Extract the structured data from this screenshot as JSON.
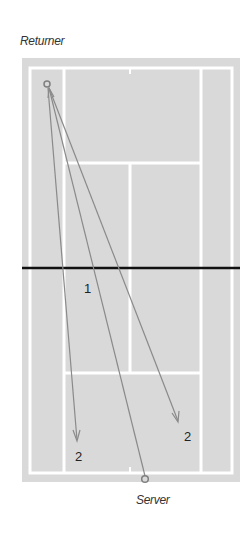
{
  "labels": {
    "top_player": "Returner",
    "bottom_player": "Server"
  },
  "colors": {
    "court_fill": "#d9d9d9",
    "court_lines": "#ffffff",
    "net": "#111111",
    "trajectory": "#8a8a8a",
    "marker": "#7f7f7f",
    "text": "#222222"
  },
  "court": {
    "surround": {
      "x": 22,
      "y": 58,
      "w": 218,
      "h": 424
    },
    "outer_lines": {
      "x": 30,
      "y": 68,
      "w": 202,
      "h": 405
    },
    "singles_left_x": 64,
    "singles_right_x": 201,
    "center_x": 130,
    "service_line_top_y": 163,
    "service_line_bottom_y": 373,
    "net_y": 268
  },
  "players": {
    "returner": {
      "x": 47,
      "y": 84
    },
    "server": {
      "x": 145,
      "y": 479
    }
  },
  "shots": [
    {
      "from": "server",
      "to": [
        47,
        84
      ],
      "label": "1",
      "label_pos": [
        84,
        292
      ]
    },
    {
      "from": "returner",
      "to": [
        77,
        440
      ],
      "label": "2",
      "label_pos": [
        75,
        460
      ]
    },
    {
      "from": "returner",
      "to": [
        178,
        420
      ],
      "label": "2",
      "label_pos": [
        184,
        441
      ]
    }
  ],
  "shot_labels": [
    "1",
    "2",
    "2"
  ]
}
